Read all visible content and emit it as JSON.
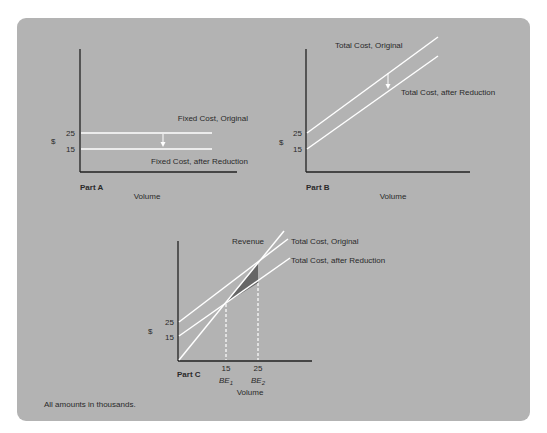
{
  "header": {
    "cutoff_text": "Fixed and Variable Cost"
  },
  "part_a": {
    "label": "Part A",
    "x_label": "Volume",
    "y_label": "$",
    "ticks": [
      "25",
      "15"
    ],
    "line_top": "Fixed Cost, Original",
    "line_bottom": "Fixed Cost, after Reduction"
  },
  "part_b": {
    "label": "Part B",
    "x_label": "Volume",
    "y_label": "$",
    "ticks": [
      "25",
      "15"
    ],
    "line_top": "Total Cost, Original",
    "line_bottom": "Total Cost, after Reduction"
  },
  "part_c": {
    "label": "Part C",
    "x_label": "Volume",
    "y_label": "$",
    "y_ticks": [
      "25",
      "15"
    ],
    "x_ticks": [
      "15",
      "25"
    ],
    "be1": "BE",
    "be1_sub": "1",
    "be2": "BE",
    "be2_sub": "2",
    "revenue": "Revenue",
    "line_top": "Total Cost, Original",
    "line_bottom": "Total Cost, after Reduction"
  },
  "footnote": "All amounts in thousands.",
  "colors": {
    "panel": "#b3b3b3",
    "lines": "#ffffff",
    "axes": "#222222",
    "shaded": "#666666"
  }
}
